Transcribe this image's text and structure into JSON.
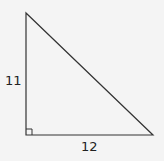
{
  "diagram": {
    "type": "right-triangle",
    "vertices": {
      "top": [
        26,
        13
      ],
      "right_angle": [
        26,
        135
      ],
      "bottom_right": [
        153,
        135
      ]
    },
    "right_angle_marker_size": 6,
    "labels": {
      "vertical_leg": "11",
      "horizontal_leg": "12"
    },
    "colors": {
      "background": "#f4f4f4",
      "stroke": "#333333",
      "text": "#222222"
    }
  }
}
